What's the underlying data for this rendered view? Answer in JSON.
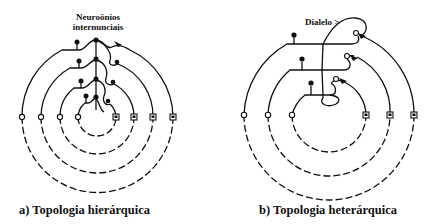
{
  "figure": {
    "panel_a": {
      "caption": "a) Topologia hierárquica",
      "annotation_line1": "Neuroônios",
      "annotation_line2": "internunciais",
      "rings": 4,
      "description": "Four concentric rings; each ring connects an input (open circle, left) through an interneuron chain to an output (square, right)"
    },
    "panel_b": {
      "caption": "b) Topologia heterárquica",
      "annotation": "Dialelo >",
      "rings": 3,
      "description": "Three concentric rings with cross-level loops (dialelo)"
    },
    "colors": {
      "line": "#111111",
      "background": "#ffffff"
    }
  }
}
